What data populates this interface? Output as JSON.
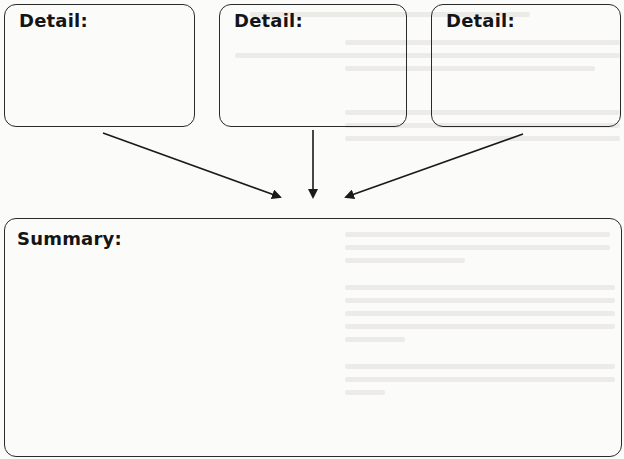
{
  "organizer": {
    "details": [
      {
        "label": "Detail:"
      },
      {
        "label": "Detail:"
      },
      {
        "label": "Detail:"
      }
    ],
    "summary": {
      "label": "Summary:"
    },
    "colors": {
      "stroke": "#2a2a2a",
      "text": "#151515",
      "background": "#fbfbfa"
    }
  }
}
